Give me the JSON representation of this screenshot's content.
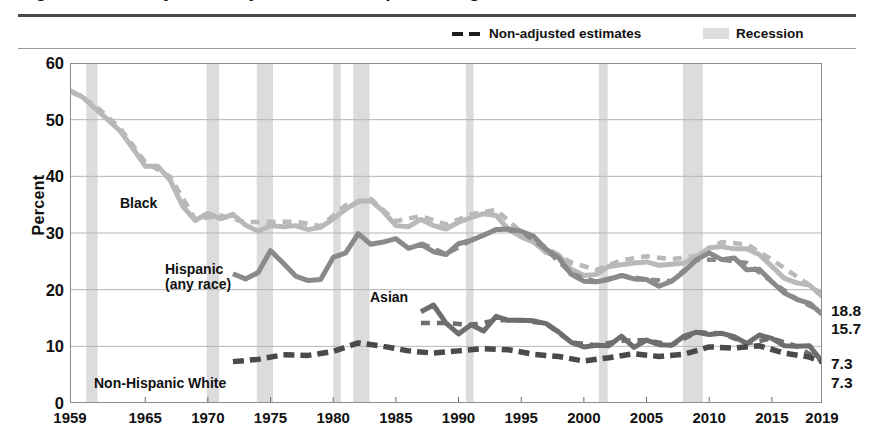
{
  "figure": {
    "title": "Figure 4. Poverty Rates by Race and Hispanic Origin: 1959 to 2019",
    "ylabel": "Percent"
  },
  "legend": {
    "items": [
      {
        "label": "Non-adjusted estimates",
        "marker": "dashed-line",
        "color": "#1d1d1d"
      },
      {
        "label": "Recession",
        "marker": "shaded-band",
        "color": "#dcdcdc"
      }
    ]
  },
  "annotations": [
    {
      "name": "black",
      "text": "Black",
      "x": 120,
      "y": 196
    },
    {
      "name": "hispanic",
      "text": "Hispanic",
      "x": 165,
      "y": 262
    },
    {
      "name": "hispanic2",
      "text": "(any race)",
      "x": 165,
      "y": 277
    },
    {
      "name": "asian",
      "text": "Asian",
      "x": 370,
      "y": 290
    },
    {
      "name": "non-hispanic-white",
      "text": "Non-Hispanic White",
      "x": 94,
      "y": 376
    }
  ],
  "end_labels": [
    {
      "name": "black-end",
      "value": "18.8",
      "y": 302
    },
    {
      "name": "hispanic-end",
      "value": "15.7",
      "y": 320
    },
    {
      "name": "asian-end",
      "value": "7.3",
      "y": 355
    },
    {
      "name": "white-end",
      "value": "7.3",
      "y": 374
    }
  ],
  "chart_data": {
    "type": "line",
    "title": "Poverty Rates by Race and Hispanic Origin: 1959 to 2019",
    "xlabel": "",
    "ylabel": "Percent",
    "xlim": [
      1959,
      2019
    ],
    "ylim": [
      0,
      60
    ],
    "yticks": [
      0,
      10,
      20,
      30,
      40,
      50,
      60
    ],
    "xticks": [
      1959,
      1965,
      1970,
      1975,
      1980,
      1985,
      1990,
      1995,
      2000,
      2005,
      2010,
      2015,
      2019
    ],
    "grid": "horizontal",
    "legend_position": "top-right",
    "colors": {
      "black": "#b9b9b9",
      "hispanic": "#8a8a8a",
      "asian": "#6e6e6e",
      "white": "#4a4a4a",
      "recession": "#dcdcdc",
      "grid": "#b5b5b5",
      "axis": "#6a6a6a"
    },
    "recessions": [
      {
        "start": 1960.3,
        "end": 1961.2
      },
      {
        "start": 1969.9,
        "end": 1970.9
      },
      {
        "start": 1973.9,
        "end": 1975.2
      },
      {
        "start": 1980.0,
        "end": 1980.6
      },
      {
        "start": 1981.6,
        "end": 1982.9
      },
      {
        "start": 1990.6,
        "end": 1991.2
      },
      {
        "start": 2001.2,
        "end": 2001.9
      },
      {
        "start": 2007.9,
        "end": 2009.5
      }
    ],
    "series": [
      {
        "name": "Black",
        "style": "solid",
        "color": "#b9b9b9",
        "end_value": 18.8,
        "x": [
          1959,
          1960,
          1961,
          1962,
          1963,
          1964,
          1965,
          1966,
          1967,
          1968,
          1969,
          1970,
          1971,
          1972,
          1973,
          1974,
          1975,
          1976,
          1977,
          1978,
          1979,
          1980,
          1981,
          1982,
          1983,
          1984,
          1985,
          1986,
          1987,
          1988,
          1989,
          1990,
          1991,
          1992,
          1993,
          1994,
          1995,
          1996,
          1997,
          1998,
          1999,
          2000,
          2001,
          2002,
          2003,
          2004,
          2005,
          2006,
          2007,
          2008,
          2009,
          2010,
          2011,
          2012,
          2013,
          2014,
          2015,
          2016,
          2017,
          2018,
          2019
        ],
        "values": [
          55.1,
          54.0,
          52.0,
          50.0,
          48.0,
          45.0,
          41.8,
          41.8,
          39.3,
          34.7,
          32.2,
          33.5,
          32.5,
          33.3,
          31.4,
          30.3,
          31.3,
          31.1,
          31.3,
          30.6,
          31.0,
          32.5,
          34.2,
          35.6,
          35.7,
          33.8,
          31.3,
          31.1,
          32.4,
          31.3,
          30.7,
          31.9,
          32.7,
          33.4,
          33.1,
          30.6,
          29.3,
          28.4,
          26.5,
          26.1,
          23.6,
          22.5,
          22.7,
          24.1,
          24.4,
          24.7,
          24.9,
          24.3,
          24.5,
          24.7,
          25.8,
          27.4,
          27.6,
          27.2,
          27.2,
          26.2,
          24.1,
          22.0,
          21.2,
          20.8,
          18.8
        ]
      },
      {
        "name": "Black (non-adjusted)",
        "style": "dashed",
        "color": "#b9b9b9",
        "x": [
          1959,
          1961,
          1963,
          1965,
          1967,
          1969,
          1971,
          1973,
          1975,
          1977,
          1979,
          1981,
          1983,
          1985,
          1987,
          1989,
          1991,
          1993,
          1995,
          1997,
          1999,
          2001,
          2003,
          2005,
          2007,
          2009,
          2011,
          2013,
          2015,
          2017,
          2019
        ],
        "values": [
          55.1,
          52.5,
          48.5,
          42.5,
          39.9,
          32.4,
          33.1,
          31.9,
          32.0,
          32.0,
          31.2,
          34.9,
          36.0,
          32.1,
          33.0,
          31.5,
          33.3,
          34.1,
          30.2,
          27.4,
          24.8,
          23.5,
          25.2,
          25.9,
          25.4,
          26.0,
          28.4,
          28.0,
          25.3,
          22.3,
          19.3
        ]
      },
      {
        "name": "Hispanic (any race)",
        "style": "solid",
        "color": "#8a8a8a",
        "end_value": 15.7,
        "x": [
          1972,
          1973,
          1974,
          1975,
          1976,
          1977,
          1978,
          1979,
          1980,
          1981,
          1982,
          1983,
          1984,
          1985,
          1986,
          1987,
          1988,
          1989,
          1990,
          1991,
          1992,
          1993,
          1994,
          1995,
          1996,
          1997,
          1998,
          1999,
          2000,
          2001,
          2002,
          2003,
          2004,
          2005,
          2006,
          2007,
          2008,
          2009,
          2010,
          2011,
          2012,
          2013,
          2014,
          2015,
          2016,
          2017,
          2018,
          2019
        ],
        "values": [
          22.8,
          21.9,
          23.0,
          26.9,
          24.7,
          22.4,
          21.6,
          21.8,
          25.7,
          26.5,
          29.9,
          28.0,
          28.4,
          29.0,
          27.3,
          28.0,
          26.7,
          26.2,
          28.1,
          28.7,
          29.6,
          30.6,
          30.7,
          30.3,
          29.4,
          27.1,
          25.6,
          22.7,
          21.5,
          21.4,
          21.8,
          22.5,
          21.9,
          21.8,
          20.6,
          21.5,
          23.2,
          25.3,
          26.5,
          25.3,
          25.6,
          23.5,
          23.6,
          21.4,
          19.4,
          18.3,
          17.6,
          15.7
        ]
      },
      {
        "name": "Hispanic (non-adjusted)",
        "style": "dashed",
        "color": "#8a8a8a",
        "x": [
          1987,
          1989,
          1991,
          1993,
          1995,
          1997,
          1999,
          2001,
          2003,
          2005,
          2007,
          2009,
          2011,
          2013,
          2015,
          2017,
          2019
        ],
        "values": [
          28.2,
          26.3,
          28.7,
          30.6,
          30.3,
          27.1,
          22.8,
          21.4,
          22.5,
          21.8,
          21.5,
          25.3,
          25.3,
          24.7,
          21.4,
          18.3,
          16.1
        ]
      },
      {
        "name": "Asian",
        "style": "solid",
        "color": "#6e6e6e",
        "end_value": 7.3,
        "x": [
          1987,
          1988,
          1989,
          1990,
          1991,
          1992,
          1993,
          1994,
          1995,
          1996,
          1997,
          1998,
          1999,
          2000,
          2001,
          2002,
          2003,
          2004,
          2005,
          2006,
          2007,
          2008,
          2009,
          2010,
          2011,
          2012,
          2013,
          2014,
          2015,
          2016,
          2017,
          2018,
          2019
        ],
        "values": [
          16.1,
          17.3,
          14.1,
          12.2,
          13.8,
          12.7,
          15.3,
          14.6,
          14.6,
          14.5,
          14.0,
          12.5,
          10.7,
          9.9,
          10.2,
          10.1,
          11.8,
          9.8,
          11.1,
          10.3,
          10.2,
          11.8,
          12.5,
          12.1,
          12.3,
          11.7,
          10.5,
          12.0,
          11.4,
          10.1,
          10.0,
          10.1,
          7.3
        ]
      },
      {
        "name": "Asian (non-adjusted)",
        "style": "dashed",
        "color": "#6e6e6e",
        "x": [
          1987,
          1989,
          1991,
          1993,
          1995,
          1997,
          1999,
          2001,
          2003,
          2005,
          2007,
          2009,
          2011,
          2013,
          2015,
          2017,
          2019
        ],
        "values": [
          14.1,
          14.1,
          13.8,
          14.6,
          14.6,
          14.0,
          10.7,
          10.2,
          11.0,
          11.1,
          10.2,
          12.5,
          12.3,
          10.5,
          11.4,
          10.0,
          7.3
        ]
      },
      {
        "name": "Non-Hispanic White",
        "style": "dashed-thick",
        "color": "#4a4a4a",
        "end_value": 7.3,
        "x": [
          1972,
          1974,
          1976,
          1978,
          1980,
          1982,
          1984,
          1986,
          1988,
          1990,
          1992,
          1994,
          1996,
          1998,
          2000,
          2002,
          2004,
          2006,
          2008,
          2010,
          2012,
          2014,
          2016,
          2018,
          2019
        ],
        "values": [
          7.3,
          7.7,
          8.5,
          8.4,
          9.1,
          10.6,
          10.0,
          9.2,
          8.8,
          9.2,
          9.6,
          9.4,
          8.6,
          8.2,
          7.4,
          8.0,
          8.7,
          8.2,
          8.6,
          9.9,
          9.7,
          10.1,
          8.8,
          8.1,
          7.3
        ]
      }
    ]
  }
}
